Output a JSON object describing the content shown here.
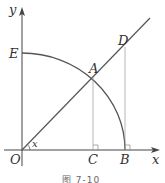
{
  "figure": {
    "caption": "图 7-10",
    "labels": {
      "y_axis": "y",
      "x_axis": "x",
      "origin": "O",
      "E": "E",
      "A": "A",
      "D": "D",
      "C": "C",
      "B": "B",
      "angle": "x"
    },
    "colors": {
      "line": "#555555",
      "thin": "#999999",
      "text": "#333333"
    }
  }
}
